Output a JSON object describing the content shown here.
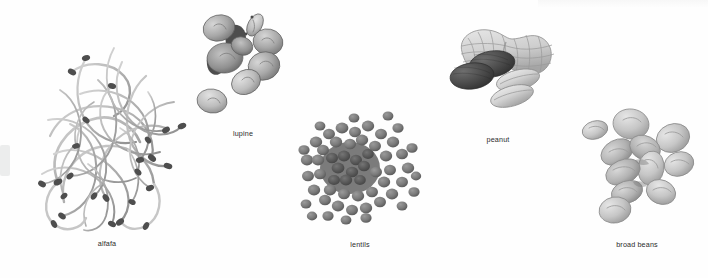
{
  "figure": {
    "background_color": "#fefefe",
    "label_color": "#2b2b2b",
    "style": "grayscale photographic specimens on white background"
  },
  "specimens": [
    {
      "id": "alfafa",
      "label": "alfafa",
      "icon": "alfalfa-sprouts-icon",
      "description": "tangled mass of thin curly sprout strands with dark seed heads",
      "center_x": 107,
      "center_y": 140,
      "label_x": 107,
      "label_y": 243,
      "colors": {
        "strand": "#b9b9b9",
        "strand_dark": "#8a8a8a",
        "seed": "#4a4a4a"
      }
    },
    {
      "id": "lupine",
      "label": "lupine",
      "icon": "lupine-seeds-icon",
      "description": "cluster of flat rounded disc-shaped seeds",
      "center_x": 243,
      "center_y": 62,
      "label_x": 243,
      "label_y": 133,
      "colors": {
        "seed_light": "#c9c9c9",
        "seed_mid": "#9d9d9d",
        "seed_dark": "#6e6e6e"
      }
    },
    {
      "id": "lentils",
      "label": "lentils",
      "icon": "lentils-pile-icon",
      "description": "scattered pile of many small round flat discs",
      "center_x": 360,
      "center_y": 170,
      "label_x": 360,
      "label_y": 244,
      "colors": {
        "lentil": "#7d7d7d",
        "lentil_dark": "#5e5e5e",
        "lentil_light": "#949494"
      }
    },
    {
      "id": "peanut",
      "label": "peanut",
      "icon": "peanut-icon",
      "description": "textured peanut shell with dark roasted kernels and pale blanched kernels",
      "center_x": 498,
      "center_y": 65,
      "label_x": 498,
      "label_y": 139,
      "colors": {
        "shell": "#d2d2d2",
        "shell_line": "#8f8f8f",
        "kernel_dark": "#4f4f4f",
        "kernel_light": "#d8d8d8"
      }
    },
    {
      "id": "broad-beans",
      "label": "broad beans",
      "icon": "broad-beans-icon",
      "description": "scattered group of pale flat oval beans",
      "center_x": 637,
      "center_y": 168,
      "label_x": 637,
      "label_y": 244,
      "colors": {
        "bean": "#cfcfcf",
        "bean_shade": "#a6a6a6",
        "bean_edge": "#8b8b8b"
      }
    }
  ]
}
